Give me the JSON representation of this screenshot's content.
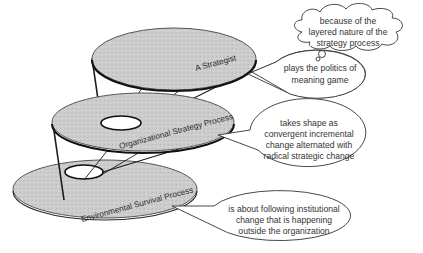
{
  "diagram": {
    "type": "layered-disc-diagram",
    "layers": [
      {
        "id": "top",
        "label": "A Strategist",
        "callout": [
          "plays the politics of",
          "meaning game"
        ]
      },
      {
        "id": "middle",
        "label": "Organizational Strategy Process",
        "callout": [
          "takes shape as",
          "convergent incremental",
          "change alternated with",
          "radical strategic change"
        ]
      },
      {
        "id": "bottom",
        "label": "Environmental Survival Process",
        "callout": [
          "is about following institutional",
          "change that is happening",
          "outside the organization"
        ]
      }
    ],
    "thought_cloud": [
      "because of the",
      "layered nature of the",
      "strategy process"
    ],
    "colors": {
      "disc_fill": "#c9c9c9",
      "disc_edge": "#1a1a1a",
      "callout_fill": "#ffffff",
      "callout_edge": "#333333"
    }
  }
}
